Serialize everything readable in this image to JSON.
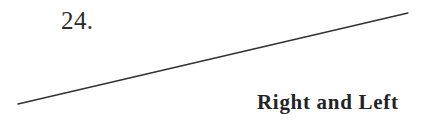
{
  "page": {
    "width": 432,
    "height": 124,
    "background_color": "#ffffff"
  },
  "plate": {
    "number_label": "24.",
    "color": "#2b2b2d"
  },
  "caption": {
    "text": "Right and Left",
    "color": "#232326"
  },
  "rule": {
    "label": "diagonal-rule",
    "color": "#303036",
    "thickness": 1.3,
    "x1": 18,
    "y1": 104,
    "x2": 408,
    "y2": 13
  }
}
